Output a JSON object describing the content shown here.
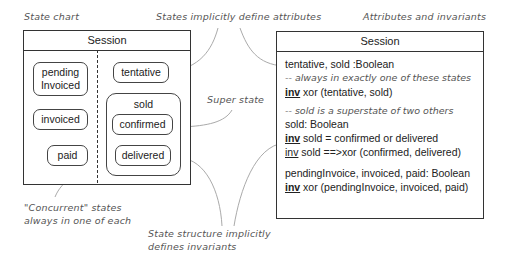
{
  "labels": {
    "state_chart": "State chart",
    "states_define_attributes": "States implicitly define attributes",
    "attributes_and_invariants": "Attributes and invariants",
    "super_state": "Super state",
    "concurrent_line1": "\"Concurrent\" states",
    "concurrent_line2": "always in one of each",
    "structure_line1": "State structure implicitly",
    "structure_line2": "defines invariants"
  },
  "state_chart": {
    "title": "Session",
    "left_region": {
      "states": [
        {
          "label_line1": "pending",
          "label_line2": "Invoiced"
        },
        {
          "label": "invoiced"
        },
        {
          "label": "paid"
        }
      ]
    },
    "right_region": {
      "tentative": "tentative",
      "superstate": {
        "label": "sold",
        "substates": [
          "confirmed",
          "delivered"
        ]
      }
    }
  },
  "class_box": {
    "title": "Session",
    "block1": {
      "attr": "tentative, sold :Boolean",
      "comment": "-- always in exactly one of these states",
      "inv_kw": "inv",
      "inv_text": " xor (tentative, sold)"
    },
    "block2": {
      "comment": "-- sold is a superstate of two others",
      "attr": "sold: Boolean",
      "inv1_kw": "inv",
      "inv1_text": " sold = confirmed or delivered",
      "inv2_kw": "inv",
      "inv2_text": " sold ==>xor (confirmed, delivered)"
    },
    "block3": {
      "attr": "pendingInvoice, invoiced, paid: Boolean",
      "inv_kw": "inv",
      "inv_text": " xor (pendingInvoice, invoiced, paid)"
    }
  },
  "colors": {
    "line": "#333333",
    "annotation_text": "#555555",
    "callout_curve": "#aaaaaa"
  }
}
